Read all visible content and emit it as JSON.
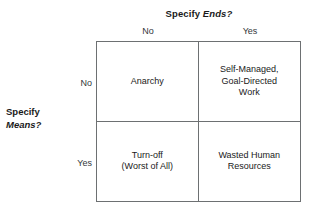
{
  "diagram": {
    "column_axis": {
      "title_prefix": "Specify ",
      "title_emphasis": "Ends?",
      "headers": [
        "No",
        "Yes"
      ]
    },
    "row_axis": {
      "title_prefix": "Specify",
      "title_emphasis": "Means?",
      "headers": [
        "No",
        "Yes"
      ]
    },
    "cells": [
      {
        "label": "Anarchy"
      },
      {
        "label": "Self-Managed,\nGoal-Directed\nWork"
      },
      {
        "label": "Turn-off\n(Worst of All)"
      },
      {
        "label": "Wasted Human\nResources"
      }
    ],
    "colors": {
      "border": "#6d7072",
      "text": "#1a1a1a",
      "axis_label_text": "#33373a",
      "background": "#ffffff"
    }
  }
}
